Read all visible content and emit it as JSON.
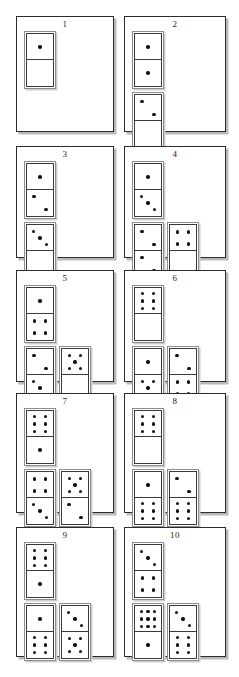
{
  "document": {
    "title": "Domino tile arrangement figure",
    "description": "Ten numbered panels, each showing vertical domino tiles with pip patterns",
    "panel_count": 10,
    "columns": 2,
    "rows": 5,
    "colors": {
      "pip": "#121212",
      "panel_border": "#2b2b2b",
      "tile_border": "#3a3a3a",
      "tile_outer_border": "#8c8c8c",
      "shadow": "#b9b9b9",
      "background": "#ffffff"
    }
  },
  "panels": [
    {
      "number": "1",
      "label": "1",
      "groups": [
        {
          "row": 1,
          "tiles": [
            {
              "top": 1,
              "bottom": 0
            }
          ]
        }
      ]
    },
    {
      "number": "2",
      "label": "2",
      "groups": [
        {
          "row": 1,
          "tiles": [
            {
              "top": 1,
              "bottom": 1
            }
          ]
        },
        {
          "row": 2,
          "tiles": [
            {
              "top": 2,
              "bottom": 0
            }
          ]
        }
      ]
    },
    {
      "number": "3",
      "label": "3",
      "groups": [
        {
          "row": 1,
          "tiles": [
            {
              "top": 1,
              "bottom": 2
            }
          ]
        },
        {
          "row": 2,
          "tiles": [
            {
              "top": 3,
              "bottom": 0
            }
          ]
        }
      ]
    },
    {
      "number": "4",
      "label": "4",
      "groups": [
        {
          "row": 1,
          "tiles": [
            {
              "top": 1,
              "bottom": 3
            }
          ]
        },
        {
          "row": 2,
          "tiles": [
            {
              "top": 2,
              "bottom": 2
            },
            {
              "top": 4,
              "bottom": 0
            }
          ]
        }
      ]
    },
    {
      "number": "5",
      "label": "5",
      "groups": [
        {
          "row": 1,
          "tiles": [
            {
              "top": 1,
              "bottom": 4
            }
          ]
        },
        {
          "row": 2,
          "tiles": [
            {
              "top": 2,
              "bottom": 3
            },
            {
              "top": 5,
              "bottom": 0
            }
          ]
        }
      ]
    },
    {
      "number": "6",
      "label": "6",
      "groups": [
        {
          "row": 1,
          "tiles": [
            {
              "top": 6,
              "bottom": 0
            }
          ]
        },
        {
          "row": 2,
          "tiles": [
            {
              "top": 1,
              "bottom": 5
            },
            {
              "top": 2,
              "bottom": 4
            }
          ]
        }
      ]
    },
    {
      "number": "7",
      "label": "7",
      "groups": [
        {
          "row": 1,
          "tiles": [
            {
              "top": 6,
              "bottom": 1
            }
          ]
        },
        {
          "row": 2,
          "tiles": [
            {
              "top": 4,
              "bottom": 3
            },
            {
              "top": 5,
              "bottom": 2
            }
          ]
        }
      ]
    },
    {
      "number": "8",
      "label": "8",
      "groups": [
        {
          "row": 1,
          "tiles": [
            {
              "top": 6,
              "bottom": 0
            }
          ]
        },
        {
          "row": 2,
          "tiles": [
            {
              "top": 1,
              "bottom": 6
            },
            {
              "top": 2,
              "bottom": 6
            }
          ]
        }
      ]
    },
    {
      "number": "9",
      "label": "9",
      "groups": [
        {
          "row": 1,
          "tiles": [
            {
              "top": 6,
              "bottom": 1
            }
          ]
        },
        {
          "row": 2,
          "tiles": [
            {
              "top": 1,
              "bottom": 6
            },
            {
              "top": 3,
              "bottom": 5
            }
          ]
        }
      ]
    },
    {
      "number": "10",
      "label": "10",
      "groups": [
        {
          "row": 1,
          "tiles": [
            {
              "top": 3,
              "bottom": 4
            }
          ]
        },
        {
          "row": 2,
          "tiles": [
            {
              "top": 9,
              "bottom": 1
            },
            {
              "top": 3,
              "bottom": 6
            }
          ]
        }
      ]
    }
  ],
  "layout": {
    "panel_geometry": [
      {
        "left": 16,
        "top": 16,
        "width": 98,
        "height": 116
      },
      {
        "left": 124,
        "top": 16,
        "width": 102,
        "height": 116
      },
      {
        "left": 16,
        "top": 146,
        "width": 98,
        "height": 112
      },
      {
        "left": 124,
        "top": 146,
        "width": 102,
        "height": 112
      },
      {
        "left": 16,
        "top": 270,
        "width": 98,
        "height": 112
      },
      {
        "left": 124,
        "top": 270,
        "width": 102,
        "height": 112
      },
      {
        "left": 16,
        "top": 393,
        "width": 98,
        "height": 120
      },
      {
        "left": 124,
        "top": 393,
        "width": 102,
        "height": 120
      },
      {
        "left": 16,
        "top": 527,
        "width": 98,
        "height": 130
      },
      {
        "left": 124,
        "top": 527,
        "width": 102,
        "height": 130
      }
    ],
    "tile": {
      "width": 26,
      "height": 52,
      "half_height": 26
    }
  }
}
